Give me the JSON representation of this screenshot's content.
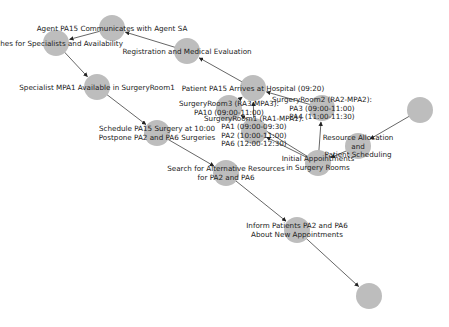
{
  "diagram": {
    "type": "directed-graph",
    "node_color": "#bdbdbd",
    "edge_color": "#555555",
    "label_color": "#222222",
    "nodes": [
      {
        "id": "n1",
        "x": 112,
        "y": 28,
        "r": 13,
        "lines": [
          "Agent PA15 Communicates with Agent SA"
        ]
      },
      {
        "id": "n2",
        "x": 56,
        "y": 43,
        "r": 13,
        "lines": [
          "arches for Specialists and Availability"
        ]
      },
      {
        "id": "n3",
        "x": 187,
        "y": 51,
        "r": 13,
        "lines": [
          "Registration and Medical Evaluation"
        ]
      },
      {
        "id": "n4",
        "x": 97,
        "y": 87,
        "r": 13,
        "lines": [
          "Specialist MPA1 Available in SurgeryRoom1"
        ]
      },
      {
        "id": "n5",
        "x": 253,
        "y": 88,
        "r": 13,
        "lines": [
          "Patient PA15 Arrives at Hospital (09:20)"
        ]
      },
      {
        "id": "n6",
        "x": 229,
        "y": 108,
        "r": 13,
        "lines": [
          "SurgeryRoom3 (RA3-MPA3):",
          "PA10 (09:00-11:00)"
        ]
      },
      {
        "id": "n7",
        "x": 322,
        "y": 108,
        "r": 13,
        "lines": [
          "SurgeryRoom2 (RA2-MPA2):",
          "PA3 (09:00-11:00)",
          "PA4 (11:00-11:30)"
        ]
      },
      {
        "id": "n8",
        "x": 254,
        "y": 131,
        "r": 13,
        "lines": [
          "SurgeryRoom1 (RA1-MPA1):",
          "PA1 (09:00-09:30)",
          "PA2 (10:00-11:00)",
          "PA6 (12:00-12:30)"
        ]
      },
      {
        "id": "n9",
        "x": 157,
        "y": 133,
        "r": 13,
        "lines": [
          "Schedule PA15 Surgery at 10:00",
          "Postpone PA2 and PA6 Surgeries"
        ]
      },
      {
        "id": "n10",
        "x": 358,
        "y": 146,
        "r": 13,
        "lines": [
          "Resource Allocation",
          "and",
          "Patient Scheduling"
        ]
      },
      {
        "id": "n11",
        "x": 318,
        "y": 163,
        "r": 13,
        "lines": [
          "Initial Appointments",
          "in Surgery Rooms"
        ]
      },
      {
        "id": "n12",
        "x": 420,
        "y": 110,
        "r": 13,
        "lines": []
      },
      {
        "id": "n13",
        "x": 226,
        "y": 173,
        "r": 13,
        "lines": [
          "Search for Alternative Resources",
          "for PA2 and PA6"
        ]
      },
      {
        "id": "n14",
        "x": 297,
        "y": 230,
        "r": 13,
        "lines": [
          "Inform Patients PA2 and PA6",
          "About New Appointments"
        ]
      },
      {
        "id": "n15",
        "x": 369,
        "y": 296,
        "r": 13,
        "lines": []
      }
    ],
    "edges": [
      {
        "from": "n12",
        "to": "n10"
      },
      {
        "from": "n10",
        "to": "n11"
      },
      {
        "from": "n11",
        "to": "n7"
      },
      {
        "from": "n11",
        "to": "n8"
      },
      {
        "from": "n11",
        "to": "n6"
      },
      {
        "from": "n7",
        "to": "n5"
      },
      {
        "from": "n8",
        "to": "n5"
      },
      {
        "from": "n6",
        "to": "n5"
      },
      {
        "from": "n5",
        "to": "n3"
      },
      {
        "from": "n3",
        "to": "n1"
      },
      {
        "from": "n1",
        "to": "n2"
      },
      {
        "from": "n2",
        "to": "n4"
      },
      {
        "from": "n4",
        "to": "n9"
      },
      {
        "from": "n9",
        "to": "n13"
      },
      {
        "from": "n13",
        "to": "n14"
      },
      {
        "from": "n14",
        "to": "n15"
      }
    ]
  }
}
